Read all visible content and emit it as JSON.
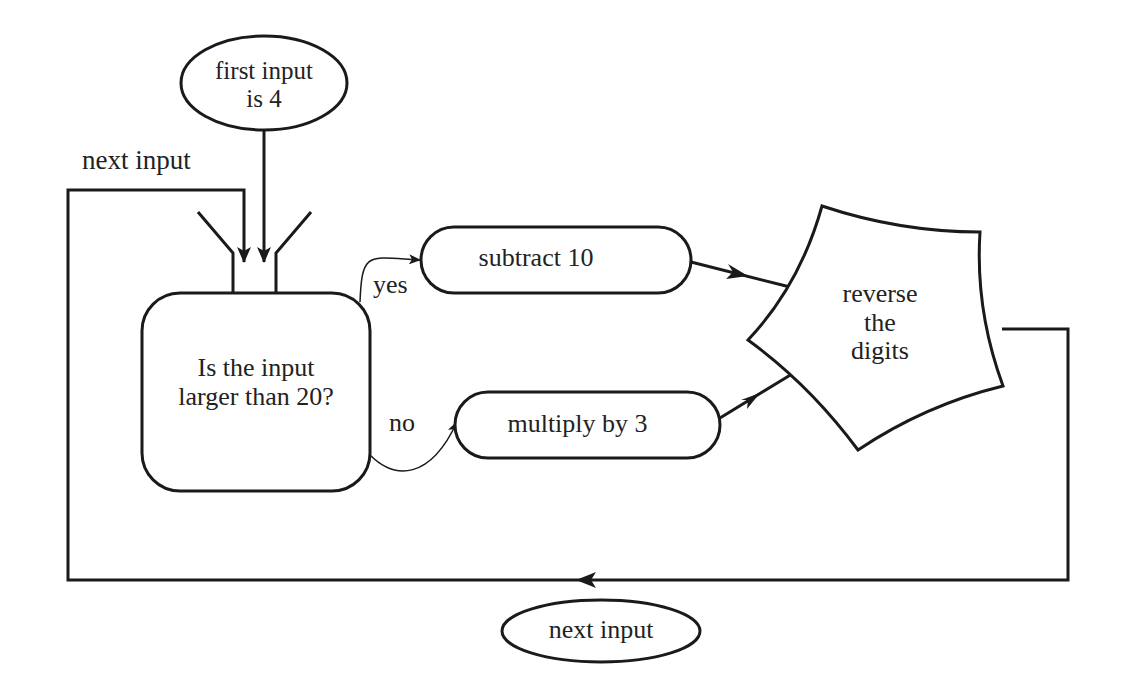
{
  "diagram": {
    "type": "flowchart",
    "colors": {
      "stroke": "#1a1a1a",
      "background": "#ffffff",
      "text": "#222222"
    },
    "nodes": {
      "start": {
        "shape": "ellipse",
        "line1": "first input",
        "line2": "is 4"
      },
      "decision": {
        "shape": "rounded-box-with-funnel",
        "line1": "Is the input",
        "line2": "larger than 20?"
      },
      "subtract": {
        "shape": "stadium",
        "label": "subtract 10"
      },
      "multiply": {
        "shape": "stadium",
        "label": "multiply by 3"
      },
      "reverse": {
        "shape": "concave-pentagon",
        "line1": "reverse",
        "line2": "the",
        "line3": "digits"
      },
      "next_bottom": {
        "shape": "ellipse",
        "label": "next input"
      }
    },
    "edge_labels": {
      "loop_in": "next input",
      "yes": "yes",
      "no": "no"
    },
    "edges": [
      {
        "from": "start",
        "to": "decision"
      },
      {
        "from": "loop",
        "to": "decision",
        "label": "next input"
      },
      {
        "from": "decision",
        "to": "subtract",
        "label": "yes"
      },
      {
        "from": "decision",
        "to": "multiply",
        "label": "no"
      },
      {
        "from": "subtract",
        "to": "reverse"
      },
      {
        "from": "multiply",
        "to": "reverse"
      },
      {
        "from": "reverse",
        "to": "loop"
      }
    ]
  }
}
